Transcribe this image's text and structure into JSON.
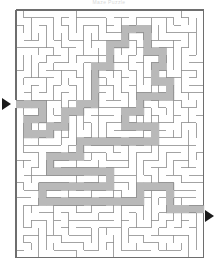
{
  "page": {
    "title": "Maze Puzzle",
    "background_color": "#ffffff"
  },
  "maze": {
    "label": "rectangular-maze",
    "cols": 25,
    "rows": 33,
    "cell_size": 7.5,
    "origin_x": 16,
    "origin_y": 10,
    "wall_color": "#8c8c8c",
    "border_color": "#6e6e6e",
    "solution_fill": "#b9b9b9",
    "passage_fill": "#ffffff",
    "entrance": {
      "label": "entrance",
      "side": "left",
      "row": 12
    },
    "exit": {
      "label": "exit",
      "side": "right",
      "row": 26
    },
    "entrance_arrow_icon": "triangle-right-icon",
    "exit_arrow_icon": "triangle-right-icon",
    "solution_cells": [
      [
        0,
        12
      ],
      [
        1,
        12
      ],
      [
        2,
        12
      ],
      [
        3,
        12
      ],
      [
        3,
        13
      ],
      [
        3,
        14
      ],
      [
        2,
        14
      ],
      [
        1,
        14
      ],
      [
        1,
        15
      ],
      [
        1,
        16
      ],
      [
        2,
        16
      ],
      [
        3,
        16
      ],
      [
        4,
        16
      ],
      [
        4,
        15
      ],
      [
        5,
        15
      ],
      [
        6,
        15
      ],
      [
        6,
        14
      ],
      [
        6,
        13
      ],
      [
        7,
        13
      ],
      [
        8,
        13
      ],
      [
        8,
        12
      ],
      [
        9,
        12
      ],
      [
        10,
        12
      ],
      [
        10,
        11
      ],
      [
        10,
        10
      ],
      [
        10,
        9
      ],
      [
        10,
        8
      ],
      [
        10,
        7
      ],
      [
        11,
        7
      ],
      [
        12,
        7
      ],
      [
        12,
        6
      ],
      [
        12,
        5
      ],
      [
        12,
        4
      ],
      [
        13,
        4
      ],
      [
        14,
        4
      ],
      [
        14,
        3
      ],
      [
        14,
        2
      ],
      [
        15,
        2
      ],
      [
        16,
        2
      ],
      [
        17,
        2
      ],
      [
        17,
        3
      ],
      [
        17,
        4
      ],
      [
        17,
        5
      ],
      [
        18,
        5
      ],
      [
        19,
        5
      ],
      [
        19,
        6
      ],
      [
        19,
        7
      ],
      [
        18,
        7
      ],
      [
        18,
        8
      ],
      [
        18,
        9
      ],
      [
        19,
        9
      ],
      [
        20,
        9
      ],
      [
        20,
        10
      ],
      [
        20,
        11
      ],
      [
        19,
        11
      ],
      [
        18,
        11
      ],
      [
        17,
        11
      ],
      [
        16,
        11
      ],
      [
        16,
        12
      ],
      [
        16,
        13
      ],
      [
        15,
        13
      ],
      [
        14,
        13
      ],
      [
        14,
        14
      ],
      [
        14,
        15
      ],
      [
        15,
        15
      ],
      [
        16,
        15
      ],
      [
        17,
        15
      ],
      [
        18,
        15
      ],
      [
        18,
        16
      ],
      [
        18,
        17
      ],
      [
        17,
        17
      ],
      [
        16,
        17
      ],
      [
        15,
        17
      ],
      [
        14,
        17
      ],
      [
        13,
        17
      ],
      [
        12,
        17
      ],
      [
        11,
        17
      ],
      [
        10,
        17
      ],
      [
        9,
        17
      ],
      [
        8,
        17
      ],
      [
        8,
        18
      ],
      [
        8,
        19
      ],
      [
        7,
        19
      ],
      [
        6,
        19
      ],
      [
        5,
        19
      ],
      [
        4,
        19
      ],
      [
        4,
        20
      ],
      [
        4,
        21
      ],
      [
        5,
        21
      ],
      [
        6,
        21
      ],
      [
        7,
        21
      ],
      [
        8,
        21
      ],
      [
        9,
        21
      ],
      [
        10,
        21
      ],
      [
        11,
        21
      ],
      [
        12,
        21
      ],
      [
        12,
        22
      ],
      [
        12,
        23
      ],
      [
        11,
        23
      ],
      [
        10,
        23
      ],
      [
        9,
        23
      ],
      [
        8,
        23
      ],
      [
        7,
        23
      ],
      [
        6,
        23
      ],
      [
        5,
        23
      ],
      [
        4,
        23
      ],
      [
        3,
        23
      ],
      [
        3,
        24
      ],
      [
        3,
        25
      ],
      [
        4,
        25
      ],
      [
        5,
        25
      ],
      [
        6,
        25
      ],
      [
        7,
        25
      ],
      [
        8,
        25
      ],
      [
        9,
        25
      ],
      [
        10,
        25
      ],
      [
        11,
        25
      ],
      [
        12,
        25
      ],
      [
        13,
        25
      ],
      [
        14,
        25
      ],
      [
        15,
        25
      ],
      [
        16,
        25
      ],
      [
        16,
        24
      ],
      [
        16,
        23
      ],
      [
        17,
        23
      ],
      [
        18,
        23
      ],
      [
        19,
        23
      ],
      [
        20,
        23
      ],
      [
        20,
        24
      ],
      [
        20,
        25
      ],
      [
        20,
        26
      ],
      [
        21,
        26
      ],
      [
        22,
        26
      ],
      [
        23,
        26
      ],
      [
        24,
        26
      ]
    ]
  }
}
